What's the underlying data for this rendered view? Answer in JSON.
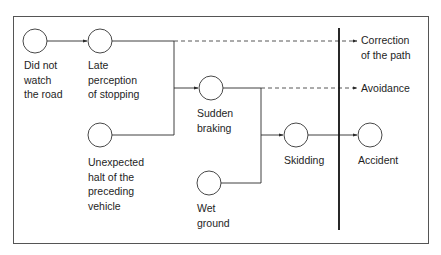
{
  "diagram": {
    "type": "cause-effect chain",
    "nodes": [
      {
        "id": "did_not_watch",
        "label": "Did not\nwatch\nthe road"
      },
      {
        "id": "late_perception",
        "label": "Late\nperception\nof stopping"
      },
      {
        "id": "unexpected_halt",
        "label": "Unexpected\nhalt of the\npreceding\nvehicle"
      },
      {
        "id": "sudden_braking",
        "label": "Sudden\nbraking"
      },
      {
        "id": "wet_ground",
        "label": "Wet\nground"
      },
      {
        "id": "skidding",
        "label": "Skidding"
      },
      {
        "id": "accident",
        "label": "Accident"
      }
    ],
    "outcomes": [
      {
        "id": "correction",
        "label": "Correction\nof the path"
      },
      {
        "id": "avoidance",
        "label": "Avoidance"
      }
    ],
    "edges": [
      {
        "from": "did_not_watch",
        "to": "late_perception",
        "style": "solid"
      },
      {
        "from": "late_perception",
        "to": "sudden_braking",
        "style": "solid"
      },
      {
        "from": "unexpected_halt",
        "to": "sudden_braking",
        "style": "solid"
      },
      {
        "from": "late_perception",
        "to": "correction",
        "style": "dashed"
      },
      {
        "from": "sudden_braking",
        "to": "avoidance",
        "style": "dashed"
      },
      {
        "from": "sudden_braking",
        "to": "skidding",
        "style": "solid"
      },
      {
        "from": "wet_ground",
        "to": "skidding",
        "style": "solid"
      },
      {
        "from": "skidding",
        "to": "accident",
        "style": "solid"
      }
    ],
    "colors": {
      "line": "#2a2a2a",
      "frame": "#555555",
      "background": "#ffffff"
    }
  }
}
